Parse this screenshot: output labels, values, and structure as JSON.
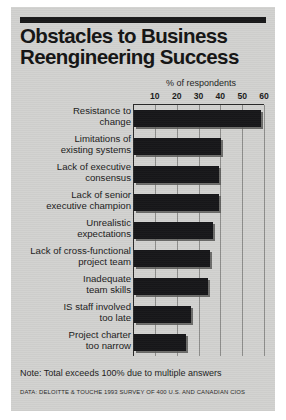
{
  "figure": {
    "title_line1": "Obstacles to Business",
    "title_line2": "Reengineering Success",
    "note": "Note: Total exceeds 100% due to multiple answers",
    "source": "DATA: DELOITTE & TOUCHE 1993 SURVEY OF 400 U.S. AND CANADIAN CIOS"
  },
  "colors": {
    "background": "#d2d2d0",
    "bar": "#17171a",
    "bar_shadow": "#5a5a58",
    "text": "#1b1b1b",
    "rule": "#19191a",
    "gridline": "#8d8d8b"
  },
  "chart_data": {
    "type": "bar",
    "orientation": "horizontal",
    "title": "Obstacles to Business Reengineering Success",
    "subtitle": "",
    "xlabel": "% of respondents",
    "ylabel": "",
    "xlim": [
      0,
      60
    ],
    "xticks": [
      10,
      20,
      30,
      40,
      50,
      60
    ],
    "grid": true,
    "legend": false,
    "categories": [
      "Resistance to change",
      "Limitations of existing systems",
      "Lack of executive consensus",
      "Lack of senior executive champion",
      "Unrealistic expectations",
      "Lack of cross-functional project team",
      "Inadequate team skills",
      "IS staff involved too late",
      "Project charter too narrow"
    ],
    "category_lines": [
      [
        "Resistance to",
        "change"
      ],
      [
        "Limitations of",
        "existing systems"
      ],
      [
        "Lack of executive",
        "consensus"
      ],
      [
        "Lack of senior",
        "executive champion"
      ],
      [
        "Unrealistic",
        "expectations"
      ],
      [
        "Lack of cross-functional",
        "project team"
      ],
      [
        "Inadequate",
        "team skills"
      ],
      [
        "IS staff involved",
        "too late"
      ],
      [
        "Project charter",
        "too narrow"
      ]
    ],
    "values": [
      58,
      40,
      39,
      39,
      36,
      35,
      34,
      26,
      24
    ],
    "annotations": [
      "Note: Total exceeds 100% due to multiple answers",
      "DATA: DELOITTE & TOUCHE 1993 SURVEY OF 400 U.S. AND CANADIAN CIOS"
    ]
  }
}
